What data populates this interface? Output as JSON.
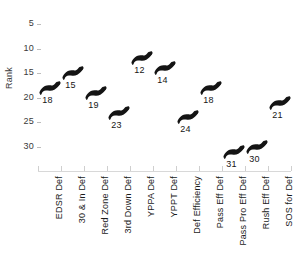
{
  "chart_data": {
    "type": "scatter",
    "title": "",
    "subtitle": "",
    "xlabel": "",
    "ylabel": "Rank",
    "categories": [
      "EDSR Def",
      "30 & In Def",
      "Red Zone Def",
      "3rd Down Def",
      "YPPA Def",
      "YPPT Def",
      "Def Efficiency",
      "Pass Eff Def",
      "Pass Pro Eff Def",
      "Rush Eff Def",
      "SOS for Def"
    ],
    "values": [
      18,
      15,
      19,
      23,
      12,
      14,
      24,
      18,
      31,
      30,
      21
    ],
    "point_labels": [
      "18",
      "15",
      "19",
      "23",
      "12",
      "14",
      "24",
      "18",
      "31",
      "30",
      "21"
    ],
    "ytick_labels": [
      "5",
      "10",
      "15",
      "20",
      "25",
      "30"
    ],
    "ytick_values": [
      5,
      10,
      15,
      20,
      25,
      30
    ],
    "ylim": [
      2,
      33
    ],
    "y_inverted": true,
    "grid": false,
    "legend": "none",
    "marker_style": "buffalo-silhouette",
    "marker_color": "#141414",
    "axis_color": "#d2d2d2",
    "text_color": "#1a1a1a",
    "background_color": "#ffffff"
  }
}
